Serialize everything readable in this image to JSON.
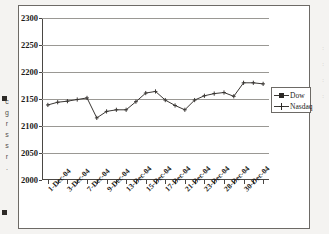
{
  "figure": {
    "frame_border_color": "#6d6a66",
    "background": "#ffffff"
  },
  "edge_text": {
    "left_fragments": [
      "c",
      "g",
      "r",
      "s",
      "s",
      "r",
      "."
    ],
    "right_fragments": [
      ":",
      ":",
      ":",
      ":"
    ]
  },
  "legend": {
    "position": "right",
    "entries": [
      {
        "label": "Dow",
        "marker": "square",
        "color": "#2b2825"
      },
      {
        "label": "Nasdaq",
        "marker": "cross",
        "color": "#2b2825"
      }
    ]
  },
  "chart_data": {
    "type": "line",
    "title": "",
    "subtitle": "",
    "xlabel": "",
    "ylabel": "",
    "ylim": [
      2000,
      2300
    ],
    "ytick_step": 50,
    "yticks": [
      2000,
      2050,
      2100,
      2150,
      2200,
      2250,
      2300
    ],
    "ytick_labels": [
      "2000",
      "2050",
      "2100",
      "2150",
      "2200",
      "2250",
      "2300"
    ],
    "grid": true,
    "grid_axis": "y",
    "grid_color": "#9a9894",
    "axis_color": "#4a4744",
    "legend_position": "right",
    "x": [
      "1-Dec-04",
      "2-Dec-04",
      "3-Dec-04",
      "6-Dec-04",
      "7-Dec-04",
      "8-Dec-04",
      "9-Dec-04",
      "10-Dec-04",
      "13-Dec-04",
      "14-Dec-04",
      "15-Dec-04",
      "16-Dec-04",
      "17-Dec-04",
      "20-Dec-04",
      "21-Dec-04",
      "22-Dec-04",
      "23-Dec-04",
      "27-Dec-04",
      "28-Dec-04",
      "29-Dec-04",
      "30-Dec-04",
      "31-Dec-04",
      "3-Jan-05"
    ],
    "xtick_labels": [
      "1-Dec-04",
      "3-Dec-04",
      "7-Dec-04",
      "9-Dec-04",
      "13-Dec-04",
      "15-Dec-04",
      "17-Dec-04",
      "21-Dec-04",
      "23-Dec-04",
      "28-Dec-04",
      "30-Dec-04"
    ],
    "xtick_label_rotation": -45,
    "xtick_count": 23,
    "series": [
      {
        "name": "Dow",
        "marker": "square",
        "color": "#2b2825",
        "values": [
          null,
          null,
          null,
          null,
          null,
          null,
          null,
          null,
          null,
          null,
          null,
          null,
          null,
          null,
          null,
          null,
          null,
          null,
          null,
          null,
          null,
          null,
          null
        ]
      },
      {
        "name": "Nasdaq",
        "marker": "cross",
        "color": "#3a3734",
        "values": [
          2139,
          2144,
          2146,
          2149,
          2152,
          2115,
          2127,
          2130,
          2130,
          2145,
          2161,
          2164,
          2148,
          2138,
          2130,
          2148,
          2156,
          2160,
          2162,
          2155,
          2180,
          2180,
          2178
        ]
      }
    ]
  }
}
